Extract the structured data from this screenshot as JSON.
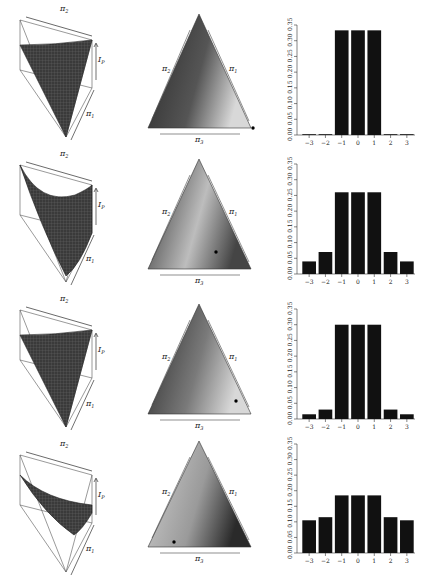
{
  "figure": {
    "rows": 4,
    "columns": [
      "3d-surface",
      "simplex-triangle",
      "bar-histogram"
    ],
    "axis_labels": {
      "pi1": "π1",
      "pi2": "π2",
      "pi3": "π3",
      "ip": "Ip"
    }
  },
  "chart_data": [
    {
      "type": "bar",
      "categories": [
        "-3",
        "-2",
        "-1",
        "0",
        "1",
        "2",
        "3"
      ],
      "values": [
        0.0,
        0.0,
        0.333,
        0.333,
        0.333,
        0.0,
        0.0
      ],
      "ylim": [
        0,
        0.35
      ],
      "yticks": [
        "0.00",
        "0.05",
        "0.10",
        "0.15",
        "0.20",
        "0.25",
        "0.30",
        "0.35"
      ],
      "xlabel": "",
      "ylabel": "",
      "grid": false,
      "surface_shape": "cone-down",
      "triangle_point": [
        0.5,
        0.02
      ],
      "triangle_point_pos": "bottom-right-vertex"
    },
    {
      "type": "bar",
      "categories": [
        "-3",
        "-2",
        "-1",
        "0",
        "1",
        "2",
        "3"
      ],
      "values": [
        0.04,
        0.07,
        0.26,
        0.26,
        0.26,
        0.07,
        0.04
      ],
      "ylim": [
        0,
        0.35
      ],
      "yticks": [
        "0.00",
        "0.05",
        "0.10",
        "0.15",
        "0.20",
        "0.25",
        "0.30",
        "0.35"
      ],
      "xlabel": "",
      "ylabel": "",
      "grid": false,
      "surface_shape": "curved-bowl",
      "triangle_point_pos": "lower-right-interior"
    },
    {
      "type": "bar",
      "categories": [
        "-3",
        "-2",
        "-1",
        "0",
        "1",
        "2",
        "3"
      ],
      "values": [
        0.015,
        0.03,
        0.3,
        0.3,
        0.3,
        0.03,
        0.015
      ],
      "ylim": [
        0,
        0.35
      ],
      "yticks": [
        "0.00",
        "0.05",
        "0.10",
        "0.15",
        "0.20",
        "0.25",
        "0.30",
        "0.35"
      ],
      "xlabel": "",
      "ylabel": "",
      "grid": false,
      "surface_shape": "cone-down",
      "triangle_point_pos": "near-bottom-right"
    },
    {
      "type": "bar",
      "categories": [
        "-3",
        "-2",
        "-1",
        "0",
        "1",
        "2",
        "3"
      ],
      "values": [
        0.105,
        0.115,
        0.185,
        0.185,
        0.185,
        0.115,
        0.105
      ],
      "ylim": [
        0,
        0.35
      ],
      "yticks": [
        "0.00",
        "0.05",
        "0.10",
        "0.15",
        "0.20",
        "0.25",
        "0.30",
        "0.35"
      ],
      "xlabel": "",
      "ylabel": "",
      "grid": false,
      "surface_shape": "shallow-sheet",
      "triangle_point_pos": "near-bottom-left"
    }
  ]
}
